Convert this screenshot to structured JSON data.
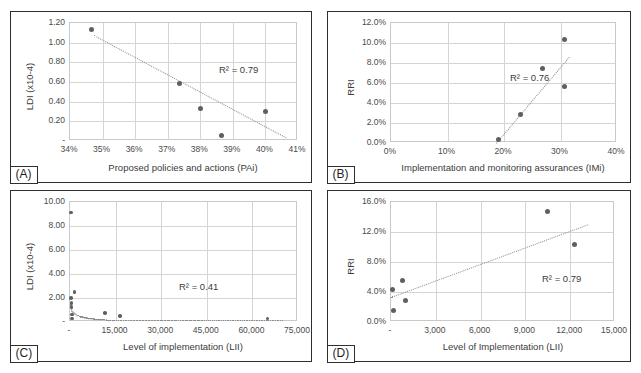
{
  "figure": {
    "panels": [
      {
        "tag": "(A)",
        "r2_label": "R² = 0.79",
        "chart_data": {
          "type": "scatter",
          "title": "",
          "xlabel": "Proposed policies and actions (PAi)",
          "ylabel": "LDI (x10-4)",
          "xlim": [
            0.34,
            0.41
          ],
          "ylim": [
            0.0,
            1.2
          ],
          "grid": true,
          "legend": "none",
          "xticks": [
            "34%",
            "35%",
            "36%",
            "37%",
            "38%",
            "39%",
            "40%",
            "41%"
          ],
          "xtick_values": [
            0.34,
            0.35,
            0.36,
            0.37,
            0.38,
            0.39,
            0.4,
            0.41
          ],
          "yticks": [
            "-",
            "0.20",
            "0.40",
            "0.60",
            "0.80",
            "1.00",
            "1.20"
          ],
          "ytick_values": [
            0.0,
            0.2,
            0.4,
            0.6,
            0.8,
            1.0,
            1.2
          ],
          "points": [
            {
              "x": 0.3465,
              "y": 1.135
            },
            {
              "x": 0.3735,
              "y": 0.58
            },
            {
              "x": 0.38,
              "y": 0.33
            },
            {
              "x": 0.3865,
              "y": 0.06
            },
            {
              "x": 0.4,
              "y": 0.305
            }
          ],
          "trendline": {
            "x0": 0.3475,
            "y0": 1.08,
            "x1": 0.4065,
            "y1": 0.04,
            "style": "dotted"
          },
          "r2": 0.79
        }
      },
      {
        "tag": "(B)",
        "r2_label": "R² = 0.76",
        "chart_data": {
          "type": "scatter",
          "title": "",
          "xlabel": "Implementation and monitoring assurances (IMi)",
          "ylabel": "RRI",
          "xlim": [
            0.0,
            0.4
          ],
          "ylim": [
            0.0,
            0.12
          ],
          "grid": true,
          "legend": "none",
          "xticks": [
            "0%",
            "10%",
            "20%",
            "30%",
            "40%"
          ],
          "xtick_values": [
            0.0,
            0.1,
            0.2,
            0.3,
            0.4
          ],
          "yticks": [
            "0.0%",
            "2.0%",
            "4.0%",
            "6.0%",
            "8.0%",
            "10.0%",
            "12.0%"
          ],
          "ytick_values": [
            0.0,
            0.02,
            0.04,
            0.06,
            0.08,
            0.1,
            0.12
          ],
          "points": [
            {
              "x": 0.19,
              "y": 0.0035
            },
            {
              "x": 0.23,
              "y": 0.029
            },
            {
              "x": 0.268,
              "y": 0.075
            },
            {
              "x": 0.307,
              "y": 0.104
            },
            {
              "x": 0.307,
              "y": 0.0565
            }
          ],
          "trendline": {
            "x0": 0.186,
            "y0": 0.0,
            "x1": 0.315,
            "y1": 0.086,
            "style": "dotted"
          },
          "r2": 0.76
        }
      },
      {
        "tag": "(C)",
        "r2_label": "R² = 0.41",
        "chart_data": {
          "type": "scatter",
          "title": "",
          "xlabel": "Level of implementation (LII)",
          "ylabel": "LDI (x10-4)",
          "xlim": [
            0,
            75000
          ],
          "ylim": [
            0.0,
            10.0
          ],
          "grid": true,
          "legend": "none",
          "xticks": [
            "-",
            "15,000",
            "30,000",
            "45,000",
            "60,000",
            "75,000"
          ],
          "xtick_values": [
            0,
            15000,
            30000,
            45000,
            60000,
            75000
          ],
          "yticks": [
            "-",
            "2.00",
            "4.00",
            "6.00",
            "8.00",
            "10.00"
          ],
          "ytick_values": [
            0.0,
            2.0,
            4.0,
            6.0,
            8.0,
            10.0
          ],
          "points": [
            {
              "x": 300,
              "y": 9.12
            },
            {
              "x": 1500,
              "y": 2.5
            },
            {
              "x": 300,
              "y": 2.02
            },
            {
              "x": 500,
              "y": 1.58
            },
            {
              "x": 500,
              "y": 1.25
            },
            {
              "x": 600,
              "y": 0.62
            },
            {
              "x": 700,
              "y": 0.3
            },
            {
              "x": 11500,
              "y": 0.75
            },
            {
              "x": 16500,
              "y": 0.52
            },
            {
              "x": 65000,
              "y": 0.28
            }
          ],
          "trendline": {
            "type": "power-decay",
            "style": "dotted"
          },
          "r2": 0.41
        }
      },
      {
        "tag": "(D)",
        "r2_label": "R² = 0.79",
        "chart_data": {
          "type": "scatter",
          "title": "",
          "xlabel": "Level of Implementation (LII)",
          "ylabel": "RRI",
          "xlim": [
            0,
            15000
          ],
          "ylim": [
            0.0,
            0.16
          ],
          "grid": true,
          "legend": "none",
          "xticks": [
            "-",
            "3,000",
            "6,000",
            "9,000",
            "12,000",
            "15,000"
          ],
          "xtick_values": [
            0,
            3000,
            6000,
            9000,
            12000,
            15000
          ],
          "yticks": [
            "0.0%",
            "4.0%",
            "8.0%",
            "12.0%",
            "16.0%"
          ],
          "ytick_values": [
            0.0,
            0.04,
            0.08,
            0.12,
            0.16
          ],
          "points": [
            {
              "x": 100,
              "y": 0.043
            },
            {
              "x": 150,
              "y": 0.015
            },
            {
              "x": 800,
              "y": 0.056
            },
            {
              "x": 1000,
              "y": 0.029
            },
            {
              "x": 10500,
              "y": 0.147
            },
            {
              "x": 12300,
              "y": 0.104
            }
          ],
          "trendline": {
            "x0": 0,
            "y0": 0.034,
            "x1": 13200,
            "y1": 0.131,
            "style": "dotted"
          },
          "r2": 0.79
        }
      }
    ]
  }
}
